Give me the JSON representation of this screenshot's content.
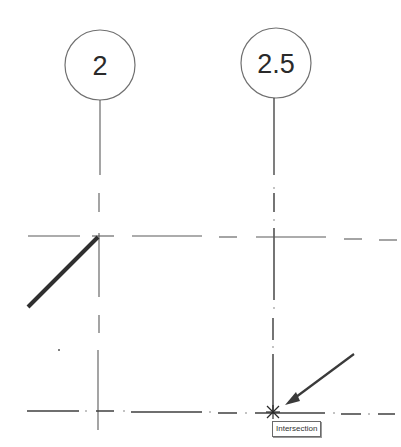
{
  "grids": {
    "vertical": [
      {
        "label": "2",
        "x": 100,
        "bubble_cy": 65,
        "bubble_r": 35
      },
      {
        "label": "2.5",
        "x": 273,
        "bubble_cy": 63,
        "bubble_r": 35
      }
    ],
    "horizontal": [
      {
        "y": 236
      },
      {
        "y": 412
      }
    ]
  },
  "drawn_line": {
    "x1": 28,
    "y1": 307,
    "x2": 98,
    "y2": 237,
    "color": "#2f2f2f"
  },
  "arrow": {
    "from": [
      354,
      355
    ],
    "to": [
      285,
      405
    ]
  },
  "snap": {
    "marker": "x-intersection",
    "x": 273,
    "y": 412,
    "tooltip_label": "Intersection"
  },
  "colors": {
    "grid_line": "#4a4a4a",
    "bubble_stroke": "#707070",
    "text": "#2a2a2a"
  }
}
